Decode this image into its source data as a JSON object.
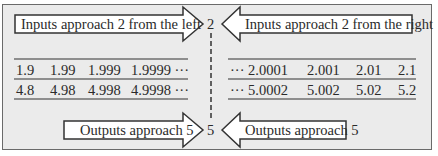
{
  "diagram": {
    "top_left_arrow": "Inputs approach 2 from the left",
    "top_right_arrow": "Inputs approach 2 from the right",
    "bottom_left_arrow": "Outputs approach 5",
    "bottom_right_arrow": "Outputs approach 5",
    "center_top_value": "2",
    "center_bottom_value": "5",
    "left_table": {
      "inputs": [
        "1.9",
        "1.99",
        "1.999",
        "1.9999 ···"
      ],
      "outputs": [
        "4.8",
        "4.98",
        "4.998",
        "4.9998 ···"
      ]
    },
    "right_table": {
      "inputs": [
        "··· 2.0001",
        "2.001",
        "2.01",
        "2.1"
      ],
      "outputs": [
        "··· 5.0002",
        "5.002",
        "5.02",
        "5.2"
      ]
    },
    "colors": {
      "background": "#ebebeb",
      "border": "#6a6a6a",
      "arrow_fill": "#ffffff",
      "text": "#2a2a2a"
    }
  }
}
